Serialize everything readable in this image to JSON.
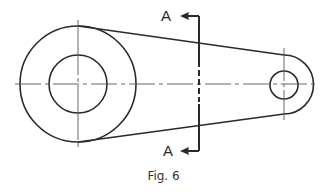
{
  "figure": {
    "caption": "Fig. 6",
    "section_labels": {
      "top": "A",
      "bottom": "A"
    },
    "colors": {
      "stroke": "#2a2a2a",
      "centerline": "#555555",
      "background": "#ffffff"
    },
    "geometry": {
      "large_boss": {
        "cx": 78,
        "cy": 84,
        "outer_r": 58,
        "bore_r": 29
      },
      "small_boss": {
        "cx": 284,
        "cy": 85,
        "outer_r": 29,
        "bore_r": 14
      },
      "cutting_plane_x": 199,
      "centerline_y": 84
    }
  }
}
